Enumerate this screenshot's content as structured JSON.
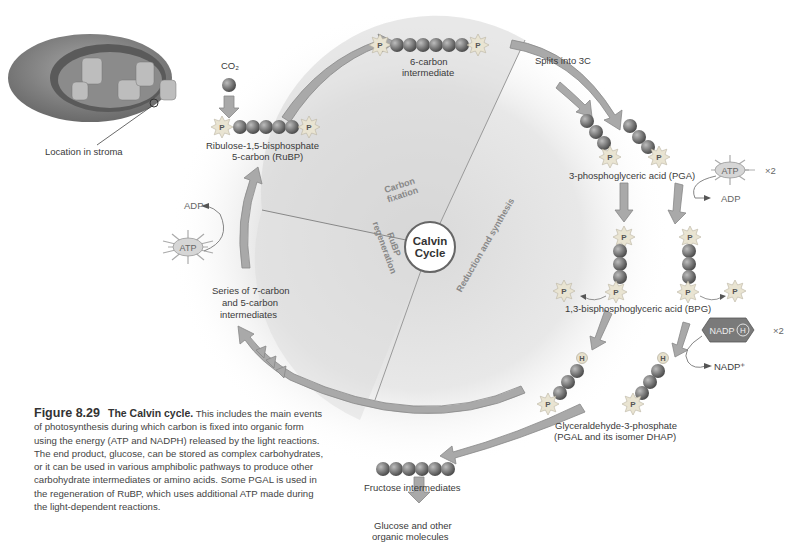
{
  "figure": {
    "number": "Figure 8.29",
    "title": "The Calvin cycle.",
    "caption": "This includes the main events of photosynthesis during which carbon is fixed into organic form using the energy (ATP and NADPH) released by the light reactions. The end product, glucose, can be stored as complex carbohydrates, or it can be used in various amphibolic pathways to produce other carbohydrate intermediates or amino acids. Some PGAL is used in the regeneration of RuBP, which uses additional ATP made during the light-dependent reactions."
  },
  "inset": {
    "label": "Location in stroma"
  },
  "center": {
    "line1": "Calvin",
    "line2": "Cycle"
  },
  "phases": {
    "carbon_fixation": [
      "Carbon",
      "fixation"
    ],
    "reduction": "Reduction and synthesis",
    "regeneration": [
      "RuBP",
      "regeneration"
    ]
  },
  "molecules": {
    "co2": "CO₂",
    "rubp_line1": "Ribulose-1,5-bisphosphate",
    "rubp_line2": "5-carbon (RuBP)",
    "six_carbon_line1": "6-carbon",
    "six_carbon_line2": "intermediate",
    "splits": "Splits into 3C",
    "pga": "3-phosphoglyceric acid (PGA)",
    "bpg": "1,3-bisphosphoglyceric acid (BPG)",
    "pgal_line1": "Glyceraldehyde-3-phosphate",
    "pgal_line2": "(PGAL and its isomer DHAP)",
    "fructose": "Fructose intermediates",
    "glucose_line1": "Glucose and other",
    "glucose_line2": "organic molecules",
    "series_line1": "Series of 7-carbon",
    "series_line2": "and 5-carbon",
    "series_line3": "intermediates"
  },
  "energy": {
    "atp": "ATP",
    "adp": "ADP",
    "x2": "×2",
    "nadph": "NADP",
    "nadph_h": "H",
    "nadp_plus": "NADP⁺",
    "phosphate": "P",
    "hydrogen": "H"
  },
  "colors": {
    "arrow": "#a9a9a9",
    "arrow_stroke": "#8a8a8a",
    "carbon": "#7d7d7d",
    "phosphate": "#e8e2cf",
    "stroma_bg": "#e6e6e6"
  }
}
